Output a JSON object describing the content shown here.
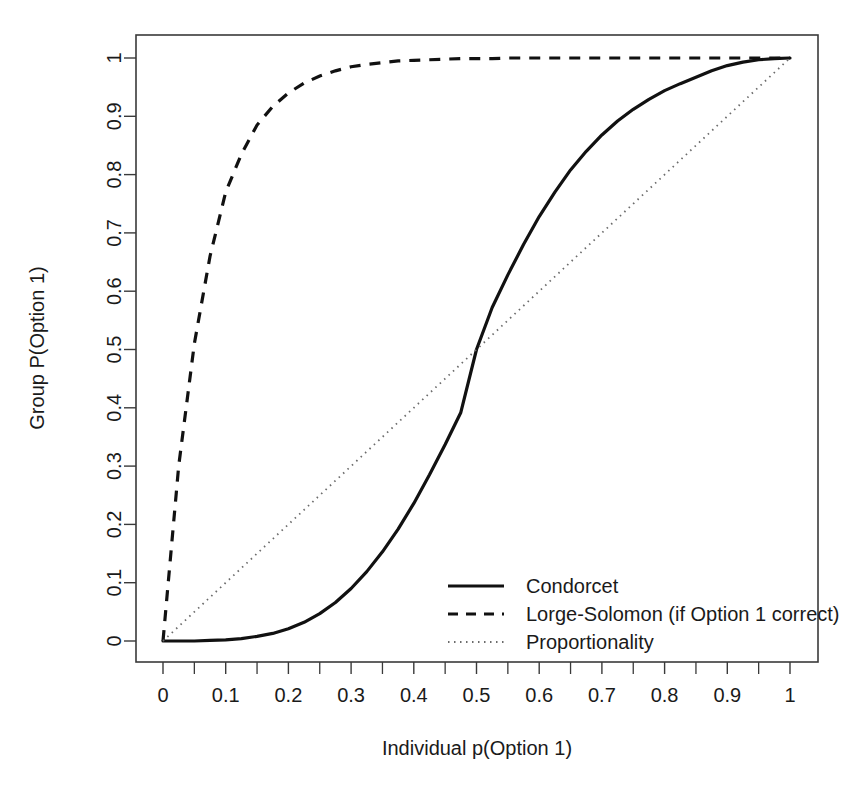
{
  "chart_data": {
    "type": "line",
    "title": "",
    "xlabel": "Individual p(Option 1)",
    "ylabel": "Group P(Option 1)",
    "xlim": [
      0,
      1
    ],
    "ylim": [
      0,
      1
    ],
    "grid": false,
    "legend_position": "bottom-right",
    "x_ticks": [
      "0",
      "0.1",
      "0.2",
      "0.3",
      "0.4",
      "0.5",
      "0.6",
      "0.7",
      "0.8",
      "0.9",
      "1"
    ],
    "x_tick_values": [
      0,
      0.1,
      0.2,
      0.3,
      0.4,
      0.5,
      0.6,
      0.7,
      0.8,
      0.9,
      1
    ],
    "x_minor_tick_values": [
      0.05,
      0.15,
      0.25,
      0.35,
      0.45,
      0.55,
      0.65,
      0.75,
      0.85,
      0.95
    ],
    "y_ticks": [
      "0",
      "0.1",
      "0.2",
      "0.3",
      "0.4",
      "0.5",
      "0.6",
      "0.7",
      "0.8",
      "0.9",
      "1"
    ],
    "y_tick_values": [
      0,
      0.1,
      0.2,
      0.3,
      0.4,
      0.5,
      0.6,
      0.7,
      0.8,
      0.9,
      1
    ],
    "x": [
      0,
      0.025,
      0.05,
      0.075,
      0.1,
      0.125,
      0.15,
      0.175,
      0.2,
      0.225,
      0.25,
      0.275,
      0.3,
      0.325,
      0.35,
      0.375,
      0.4,
      0.425,
      0.45,
      0.475,
      0.5,
      0.525,
      0.55,
      0.575,
      0.6,
      0.625,
      0.65,
      0.675,
      0.7,
      0.725,
      0.75,
      0.775,
      0.8,
      0.825,
      0.85,
      0.875,
      0.9,
      0.925,
      0.95,
      0.975,
      1
    ],
    "series": [
      {
        "name": "Condorcet",
        "style": "solid",
        "color": "#111111",
        "values": [
          0,
          0.0,
          0.0,
          0.001,
          0.002,
          0.004,
          0.008,
          0.013,
          0.021,
          0.032,
          0.047,
          0.066,
          0.09,
          0.119,
          0.153,
          0.192,
          0.236,
          0.285,
          0.337,
          0.392,
          0.5,
          0.572,
          0.628,
          0.68,
          0.728,
          0.77,
          0.808,
          0.84,
          0.868,
          0.892,
          0.912,
          0.929,
          0.944,
          0.956,
          0.967,
          0.978,
          0.987,
          0.993,
          0.997,
          0.999,
          1.0
        ]
      },
      {
        "name": "Lorge-Solomon (if Option 1 correct)",
        "style": "dashed",
        "color": "#111111",
        "values": [
          0,
          0.3,
          0.51,
          0.66,
          0.77,
          0.835,
          0.885,
          0.917,
          0.94,
          0.957,
          0.969,
          0.978,
          0.985,
          0.989,
          0.992,
          0.995,
          0.996,
          0.997,
          0.998,
          0.999,
          0.999,
          0.999,
          1.0,
          1.0,
          1.0,
          1.0,
          1.0,
          1.0,
          1.0,
          1.0,
          1.0,
          1.0,
          1.0,
          1.0,
          1.0,
          1.0,
          1.0,
          1.0,
          1.0,
          1.0,
          1.0
        ]
      },
      {
        "name": "Proportionality",
        "style": "dotted",
        "color": "#6b6b6b",
        "values": [
          0,
          0.025,
          0.05,
          0.075,
          0.1,
          0.125,
          0.15,
          0.175,
          0.2,
          0.225,
          0.25,
          0.275,
          0.3,
          0.325,
          0.35,
          0.375,
          0.4,
          0.425,
          0.45,
          0.475,
          0.5,
          0.525,
          0.55,
          0.575,
          0.6,
          0.625,
          0.65,
          0.675,
          0.7,
          0.725,
          0.75,
          0.775,
          0.8,
          0.825,
          0.85,
          0.875,
          0.9,
          0.925,
          0.95,
          0.975,
          1
        ]
      }
    ],
    "legend": [
      {
        "label": "Condorcet",
        "style": "solid"
      },
      {
        "label": "Lorge-Solomon (if Option 1 correct)",
        "style": "dashed"
      },
      {
        "label": "Proportionality",
        "style": "dotted"
      }
    ]
  }
}
